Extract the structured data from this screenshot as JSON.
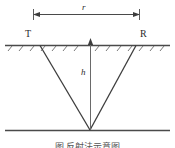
{
  "figure": {
    "title_caption": "图",
    "caption_visible_fragment": "图          反射法示意图",
    "labels": {
      "distance_r": "r",
      "transmitter": "T",
      "receiver": "R",
      "depth_h": "h"
    },
    "colors": {
      "line": "#4a4a4a",
      "ray": "#3d3d3d",
      "hatch": "#6b6b6b",
      "text": "#2b2b2b",
      "background": "#ffffff"
    },
    "geometry": {
      "dimension_line_y": 14,
      "dimension_line_x_start": 33,
      "dimension_line_x_end": 140,
      "ground_line_y": 45,
      "ground_line_x_start": 5,
      "ground_line_x_end": 170,
      "reflector_line_y": 130,
      "reflector_line_x_start": 5,
      "reflector_line_x_end": 170,
      "apex_x": 90,
      "apex_y": 130,
      "ray_left_surface_x": 40,
      "ray_right_surface_x": 136,
      "vertical_line_x": 90,
      "hatch_tick_count": 14
    }
  }
}
